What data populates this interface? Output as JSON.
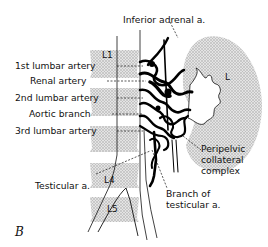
{
  "figure": {
    "panel_label": "B",
    "labels": {
      "inferior_adrenal": "Inferior adrenal a.",
      "lumbar1": "1st lumbar artery",
      "renal": "Renal artery",
      "lumbar2": "2nd lumbar artery",
      "aortic_branch": "Aortic branch",
      "lumbar3": "3rd lumbar artery",
      "testicular": "Testicular a.",
      "peripelvic_1": "Peripelvic",
      "peripelvic_2": "collateral",
      "peripelvic_3": "complex",
      "branch_testicular_1": "Branch of",
      "branch_testicular_2": "testicular a."
    },
    "vertebrae": {
      "l1": "L1",
      "l2": "L2",
      "l4": "L4",
      "l5": "L5"
    },
    "kidney_label": "L",
    "colors": {
      "ink": "#111111",
      "stipple": "#c8c8c8",
      "background": "#ffffff"
    }
  }
}
